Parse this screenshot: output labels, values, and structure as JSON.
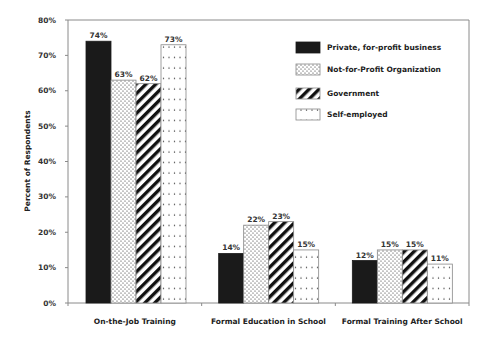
{
  "chart_data": {
    "type": "bar",
    "title": "",
    "xlabel": "",
    "ylabel": "Percent of Respondents",
    "ylim": [
      0,
      80
    ],
    "yticks": [
      "0%",
      "10%",
      "20%",
      "30%",
      "40%",
      "50%",
      "60%",
      "70%",
      "80%"
    ],
    "grid": false,
    "legend_position": "upper-right-inside",
    "categories": [
      "On-the-Job Training",
      "Formal Education in School",
      "Formal Training After School"
    ],
    "series": [
      {
        "name": "Private, for-profit business",
        "pattern": "solid-black",
        "values": [
          74,
          14,
          12
        ],
        "labels": [
          "74%",
          "14%",
          "12%"
        ]
      },
      {
        "name": "Not-for-Profit Organization",
        "pattern": "dense-dots",
        "values": [
          63,
          22,
          15
        ],
        "labels": [
          "63%",
          "22%",
          "15%"
        ]
      },
      {
        "name": "Government",
        "pattern": "diagonal-stripes",
        "values": [
          62,
          23,
          15
        ],
        "labels": [
          "62%",
          "23%",
          "15%"
        ]
      },
      {
        "name": "Self-employed",
        "pattern": "sparse-dots",
        "values": [
          73,
          15,
          11
        ],
        "labels": [
          "73%",
          "15%",
          "11%"
        ]
      }
    ]
  },
  "colors": {
    "bar_fill": "#1a1a1a",
    "axis": "#8a8a8a",
    "text": "#222222"
  }
}
